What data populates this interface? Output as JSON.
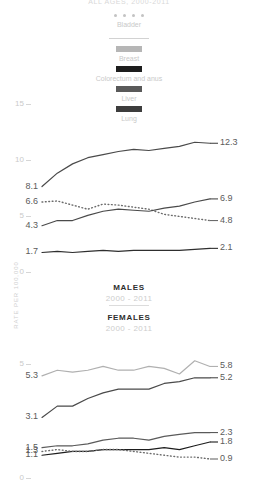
{
  "title": "ALL AGES, 2000-2011",
  "axis": {
    "ylabel": "RATE PER 100,000",
    "yticks": [
      "15",
      "10",
      "5",
      "0"
    ],
    "ylim": [
      0,
      16.5
    ]
  },
  "legend": {
    "items": [
      {
        "label": "Bladder",
        "marker": "dotted",
        "color": "#c3c3c3"
      },
      {
        "label": "Breast",
        "marker": "swatch",
        "color": "#b6b6b6"
      },
      {
        "label": "Colorectum and anus",
        "marker": "swatch",
        "color": "#1d1d1d"
      },
      {
        "label": "Liver",
        "marker": "swatch",
        "color": "#5a5a5a"
      },
      {
        "label": "Lung",
        "marker": "swatch",
        "color": "#3d3d3d"
      }
    ]
  },
  "panels": {
    "males": {
      "name": "MALES",
      "years": "2000 - 2011"
    },
    "females": {
      "name": "FEMALES",
      "years": "2000 - 2011"
    }
  },
  "chart_data": [
    {
      "type": "line",
      "title": "MALES",
      "subtitle": "2000 - 2011",
      "xlabel": "",
      "ylabel": "RATE PER 100,000",
      "ylim": [
        0,
        16.5
      ],
      "grid": false,
      "legend_position": "top-center",
      "x": [
        2000,
        2001,
        2002,
        2003,
        2004,
        2005,
        2006,
        2007,
        2008,
        2009,
        2010,
        2011
      ],
      "series": [
        {
          "name": "Lung",
          "color": "#4a4a4a",
          "style": "solid",
          "start_label": "8.1",
          "end_label": "12.3",
          "values": [
            8.1,
            9.4,
            10.3,
            10.9,
            11.2,
            11.5,
            11.7,
            11.6,
            11.8,
            12.0,
            12.4,
            12.3
          ]
        },
        {
          "name": "Bladder",
          "color": "#6b6b6b",
          "style": "dotted",
          "start_label": "6.6",
          "end_label": "4.8",
          "values": [
            6.6,
            6.7,
            6.3,
            5.9,
            6.4,
            6.3,
            6.1,
            5.9,
            5.4,
            5.2,
            5.0,
            4.8
          ]
        },
        {
          "name": "Colorectum and anus",
          "color": "#4a4a4a",
          "style": "solid",
          "start_label": "4.3",
          "end_label": "6.9",
          "values": [
            4.3,
            4.8,
            4.8,
            5.3,
            5.7,
            5.9,
            5.8,
            5.7,
            6.0,
            6.2,
            6.6,
            6.9
          ]
        },
        {
          "name": "Liver",
          "color": "#2e2e2e",
          "style": "solid",
          "start_label": "1.7",
          "end_label": "2.1",
          "values": [
            1.7,
            1.8,
            1.7,
            1.8,
            1.9,
            1.8,
            1.9,
            1.9,
            1.9,
            1.9,
            2.0,
            2.1
          ]
        }
      ]
    },
    {
      "type": "line",
      "title": "FEMALES",
      "subtitle": "2000 - 2011",
      "xlabel": "",
      "ylabel": "RATE PER 100,000",
      "ylim": [
        0,
        7.2
      ],
      "grid": false,
      "legend_position": "top-center",
      "x": [
        2000,
        2001,
        2002,
        2003,
        2004,
        2005,
        2006,
        2007,
        2008,
        2009,
        2010,
        2011
      ],
      "series": [
        {
          "name": "Breast",
          "color": "#b0b0b0",
          "style": "solid",
          "start_label": "5.3",
          "end_label": "5.8",
          "values": [
            5.3,
            5.6,
            5.5,
            5.6,
            5.8,
            5.6,
            5.6,
            5.8,
            5.7,
            5.4,
            6.1,
            5.8
          ]
        },
        {
          "name": "Lung",
          "color": "#4a4a4a",
          "style": "solid",
          "start_label": "3.1",
          "end_label": "5.2",
          "values": [
            3.1,
            3.7,
            3.7,
            4.1,
            4.4,
            4.6,
            4.6,
            4.6,
            4.9,
            5.0,
            5.2,
            5.2
          ]
        },
        {
          "name": "Colorectum and anus",
          "color": "#5a5a5a",
          "style": "solid",
          "start_label": "1.5",
          "end_label": "2.3",
          "values": [
            1.5,
            1.6,
            1.6,
            1.7,
            1.9,
            2.0,
            2.0,
            1.9,
            2.1,
            2.2,
            2.3,
            2.3
          ]
        },
        {
          "name": "Liver",
          "color": "#1d1d1d",
          "style": "solid",
          "start_label": "1.1",
          "end_label": "1.8",
          "values": [
            1.1,
            1.2,
            1.3,
            1.3,
            1.4,
            1.4,
            1.4,
            1.4,
            1.5,
            1.4,
            1.6,
            1.8
          ]
        },
        {
          "name": "Bladder",
          "color": "#6b6b6b",
          "style": "dotted",
          "start_label": "1.3",
          "end_label": "0.9",
          "values": [
            1.3,
            1.4,
            1.3,
            1.3,
            1.4,
            1.4,
            1.3,
            1.2,
            1.1,
            1.0,
            1.0,
            0.9
          ]
        }
      ]
    }
  ]
}
